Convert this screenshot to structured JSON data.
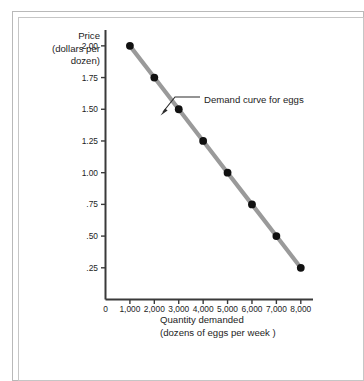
{
  "chart_data": {
    "type": "line",
    "title": "",
    "subtitle": "",
    "xlabel": "Quantity demanded (dozens of eggs per week )",
    "xlabel_lines": [
      "Quantity demanded",
      "(dozens of eggs per week )"
    ],
    "ylabel": "Price (dollars per dozen)",
    "ylabel_lines": [
      "Price",
      "(dollars per",
      "dozen)"
    ],
    "x": [
      1000,
      2000,
      3000,
      4000,
      5000,
      6000,
      7000,
      8000
    ],
    "values": [
      2.0,
      1.75,
      1.5,
      1.25,
      1.0,
      0.75,
      0.5,
      0.25
    ],
    "series": [
      {
        "name": "Demand curve for eggs",
        "values": [
          2.0,
          1.75,
          1.5,
          1.25,
          1.0,
          0.75,
          0.5,
          0.25
        ]
      }
    ],
    "xlim": [
      0,
      8500
    ],
    "ylim": [
      0,
      2.125
    ],
    "xticks": [
      0,
      1000,
      2000,
      3000,
      4000,
      5000,
      6000,
      7000,
      8000
    ],
    "xtick_labels": [
      "0",
      "1,000",
      "2,000",
      "3,000",
      "4,000",
      "5,000",
      "6,000",
      "7,000",
      "8,000"
    ],
    "yticks": [
      0.25,
      0.5,
      0.75,
      1.0,
      1.25,
      1.5,
      1.75,
      2.0
    ],
    "ytick_labels": [
      ".25",
      ".50",
      ".75",
      "1.00",
      "1.25",
      "1.50",
      "1.75",
      "2.00"
    ],
    "grid": false,
    "legend": "none",
    "annotations": [
      {
        "text": "Demand curve for eggs",
        "target_x": 2500,
        "target_y": 1.625
      }
    ],
    "colors": {
      "line": "#9a9a9a",
      "marker": "#111111",
      "axis": "#3a3a3a",
      "text": "#1d1d1d",
      "background": "#ffffff",
      "frame": "#bcbcbc"
    }
  }
}
